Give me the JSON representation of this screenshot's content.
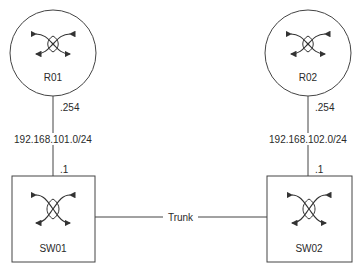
{
  "diagram": {
    "routers": [
      {
        "name": "R01",
        "icon": "router-icon",
        "interface_ip": ".254"
      },
      {
        "name": "R02",
        "icon": "router-icon",
        "interface_ip": ".254"
      }
    ],
    "switches": [
      {
        "name": "SW01",
        "icon": "switch-icon",
        "interface_ip": ".1"
      },
      {
        "name": "SW02",
        "icon": "switch-icon",
        "interface_ip": ".1"
      }
    ],
    "links": [
      {
        "from": "R01",
        "to": "SW01",
        "subnet": "192.168.101.0/24"
      },
      {
        "from": "R02",
        "to": "SW02",
        "subnet": "192.168.102.0/24"
      },
      {
        "from": "SW01",
        "to": "SW02",
        "label": "Trunk"
      }
    ],
    "colors": {
      "stroke": "#3a3a3a",
      "background": "#ffffff"
    }
  }
}
